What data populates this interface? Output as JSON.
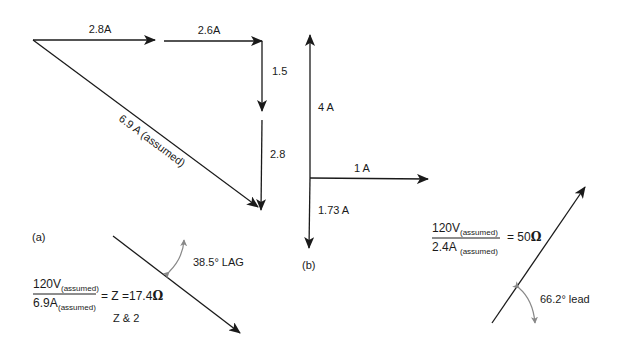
{
  "diagram": {
    "colors": {
      "line": "#1a1a1a",
      "angle_arc": "#888888",
      "background": "#ffffff"
    },
    "part_a": {
      "caption": "(a)",
      "vectors": [
        {
          "label": "2.8A"
        },
        {
          "label": "2.6A"
        },
        {
          "label": "1.5"
        },
        {
          "label": "2.8"
        },
        {
          "label": "6.9 A (assumed)"
        }
      ],
      "impedance": {
        "numerator": "120V",
        "numerator_sub": "(assumed)",
        "denominator": "6.9A",
        "denominator_sub": "(assumed)",
        "result": "= Z =17.4",
        "unit": "Ω",
        "note": "Z & 2"
      },
      "angle_label": "38.5° LAG"
    },
    "part_b": {
      "caption": "(b)",
      "vectors": [
        {
          "label": "4 A"
        },
        {
          "label": "1 A"
        },
        {
          "label": "1.73 A"
        }
      ],
      "impedance": {
        "numerator": "120V",
        "numerator_sub": "(assumed)",
        "denominator": "2.4A",
        "denominator_sub": "(assumed)",
        "result": "= 50",
        "unit": "Ω"
      },
      "angle_label": "66.2° lead"
    }
  }
}
